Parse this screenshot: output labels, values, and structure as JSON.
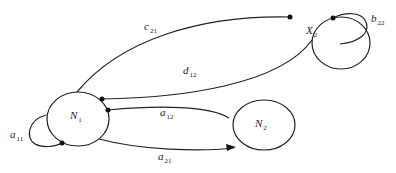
{
  "diagram": {
    "type": "directed-graph",
    "nodes": [
      {
        "id": "N1",
        "main": "N",
        "sub": "1"
      },
      {
        "id": "N2",
        "main": "N",
        "sub": "2"
      },
      {
        "id": "X2",
        "main": "X",
        "sub": "2"
      }
    ],
    "edges": [
      {
        "id": "c21",
        "main": "c",
        "sub": "21",
        "from": "N1",
        "to": "X2"
      },
      {
        "id": "d12",
        "main": "d",
        "sub": "12",
        "from": "N1",
        "to": "X2"
      },
      {
        "id": "a12",
        "main": "a",
        "sub": "12",
        "from": "N1",
        "to": "N2"
      },
      {
        "id": "a21",
        "main": "a",
        "sub": "21",
        "from": "N1",
        "to": "N2"
      },
      {
        "id": "a11",
        "main": "a",
        "sub": "11",
        "from": "N1",
        "to": "N1"
      },
      {
        "id": "b22",
        "main": "b",
        "sub": "22",
        "from": "X2",
        "to": "X2"
      }
    ]
  }
}
